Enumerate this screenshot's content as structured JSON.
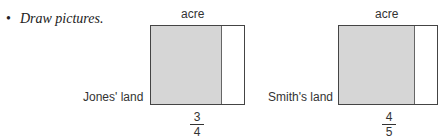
{
  "bullet": {
    "marker": "•",
    "text": "Draw pictures."
  },
  "figures": [
    {
      "top_label": "acre",
      "side_label": "Jones' land",
      "numerator": "3",
      "denominator": "4",
      "shaded_fraction": 0.75
    },
    {
      "top_label": "acre",
      "side_label": "Smith's land",
      "numerator": "4",
      "denominator": "5",
      "shaded_fraction": 0.8
    }
  ],
  "colors": {
    "shade": "#d6d6d6",
    "border": "#444444"
  }
}
